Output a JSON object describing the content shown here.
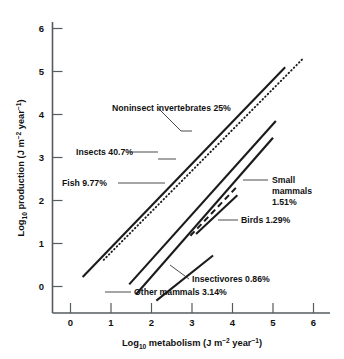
{
  "chart_data": {
    "type": "line",
    "title": "",
    "xlabel": "Log10 metabolism (J m-2 year-1)",
    "ylabel": "Log10 production (J m-2 year-1)",
    "xlabel_parts": {
      "prefix": "Log",
      "sub": "10",
      "mid": " metabolism (J m",
      "sup1": "-2",
      "mid2": " year",
      "sup2": "-1",
      "suffix": ")"
    },
    "ylabel_parts": {
      "prefix": "Log",
      "sub": "10",
      "mid": " production (J m",
      "sup1": "-2",
      "mid2": " year",
      "sup2": "-1",
      "suffix": ")"
    },
    "xlim": [
      -0.4,
      6.5
    ],
    "ylim": [
      -0.75,
      6.4
    ],
    "xticks": [
      0,
      1,
      2,
      3,
      4,
      5,
      6
    ],
    "xtick_labels": [
      "0",
      "1",
      "2",
      "3",
      "4",
      "5",
      "6"
    ],
    "xticks_minor": [
      0.5,
      1.5,
      2.5,
      3.5,
      4.5,
      5.5
    ],
    "yticks": [
      0,
      1,
      2,
      3,
      4,
      5,
      6
    ],
    "ytick_labels": [
      "0",
      "1",
      "2",
      "3",
      "4",
      "5",
      "6"
    ],
    "grid": false,
    "legend": "inline-annotations",
    "series": [
      {
        "name": "Noninsect invertebrates 25%",
        "label": "Noninsect invertebrates 25%",
        "style": "dotted",
        "x": [
          0.82,
          5.72
        ],
        "y": [
          0.62,
          5.28
        ]
      },
      {
        "name": "Insects 40.7%",
        "label": "Insects 40.7%",
        "style": "solid",
        "x": [
          0.3,
          5.3
        ],
        "y": [
          0.22,
          5.1
        ]
      },
      {
        "name": "Fish 9.77%",
        "label": "Fish 9.77%",
        "style": "solid",
        "x": [
          1.45,
          5.07
        ],
        "y": [
          0.05,
          3.85
        ]
      },
      {
        "name": "Small mammals 1.51%",
        "label_lines": [
          "Small",
          "mammals",
          "1.51%"
        ],
        "label": "Small mammals 1.51%",
        "style": "solid",
        "x": [
          1.62,
          5.0
        ],
        "y": [
          -0.18,
          3.46
        ]
      },
      {
        "name": "Birds 1.29%",
        "label": "Birds 1.29%",
        "style": "dashed",
        "x": [
          2.96,
          4.12
        ],
        "y": [
          1.18,
          2.33
        ]
      },
      {
        "name": "Insectivores 0.86%",
        "label": "Insectivores 0.86%",
        "style": "solid",
        "x": [
          2.12,
          3.52
        ],
        "y": [
          -0.33,
          0.72
        ]
      },
      {
        "name": "Other mammals 3.14%",
        "label": "Other mammals 3.14%",
        "style": "solid",
        "x": [
          3.1,
          4.12
        ],
        "y": [
          1.22,
          2.12
        ]
      }
    ],
    "annotations": [
      {
        "text": "Noninsect invertebrates 25%",
        "x": 1.42,
        "y": 4.1
      },
      {
        "text": "Insects 40.7%",
        "x": 1.05,
        "y": 3.02
      },
      {
        "text": "Fish 9.77%",
        "x": 0.72,
        "y": 2.27
      },
      {
        "text": "Small mammals 1.51%",
        "x": 4.55,
        "y": 2.28
      },
      {
        "text": "Birds 1.29%",
        "x": 4.5,
        "y": 1.35
      },
      {
        "text": "Insectivores 0.86%",
        "x": 2.62,
        "y": 0.12
      },
      {
        "text": "Other mammals 3.14%",
        "x": 1.8,
        "y": -0.45
      }
    ]
  },
  "labels": {
    "noninsect": "Noninsect invertebrates 25%",
    "insects": "Insects 40.7%",
    "fish": "Fish 9.77%",
    "small_mammals_1": "Small",
    "small_mammals_2": "mammals",
    "small_mammals_3": "1.51%",
    "birds": "Birds 1.29%",
    "insectivores": "Insectivores 0.86%",
    "other_mammals": "Other mammals 3.14%"
  },
  "axes": {
    "x_tick_0": "0",
    "x_tick_1": "1",
    "x_tick_2": "2",
    "x_tick_3": "3",
    "x_tick_4": "4",
    "x_tick_5": "5",
    "x_tick_6": "6",
    "y_tick_0": "0",
    "y_tick_1": "1",
    "y_tick_2": "2",
    "y_tick_3": "3",
    "y_tick_4": "4",
    "y_tick_5": "5",
    "y_tick_6": "6",
    "x_title_prefix": "Log",
    "x_title_sub": "10",
    "x_title_mid": " metabolism (J m",
    "x_title_sup1": "−2",
    "x_title_mid2": " year",
    "x_title_sup2": "−1",
    "x_title_suffix": ")",
    "y_title_prefix": "Log",
    "y_title_sub": "10",
    "y_title_mid": " production (J m",
    "y_title_sup1": "−2",
    "y_title_mid2": " year",
    "y_title_sup2": "−1",
    "y_title_suffix": ")"
  }
}
